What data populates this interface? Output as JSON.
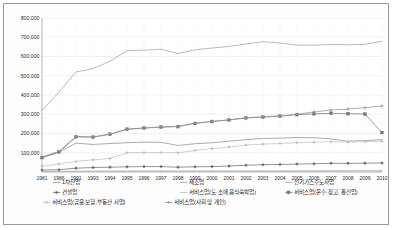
{
  "chart_data": {
    "type": "line",
    "title": "",
    "xlabel": "",
    "ylabel": "",
    "ylim": [
      0,
      800000
    ],
    "ytick_step": 100000,
    "grid": true,
    "legend_position": "bottom",
    "categories": [
      "1981",
      "1986",
      "1991",
      "1993",
      "1994",
      "1995",
      "1996",
      "1997",
      "1998",
      "1999",
      "2000",
      "2001",
      "2002",
      "2003",
      "2004",
      "2005",
      "2006",
      "2007",
      "2008",
      "2009",
      "2010"
    ],
    "ytick_labels": [
      "800,000",
      "700,000",
      "600,000",
      "500,000",
      "400,000",
      "300,000",
      "200,000",
      "100,000"
    ],
    "ytick_values": [
      800000,
      700000,
      600000,
      500000,
      400000,
      300000,
      200000,
      100000
    ],
    "series": [
      {
        "name": "1차산업",
        "color": "#8c8c8c",
        "marker": "none",
        "values": [
          75000,
          103000,
          150000,
          143000,
          148000,
          152000,
          155000,
          154000,
          138000,
          147000,
          152000,
          160000,
          168000,
          174000,
          176000,
          179000,
          178000,
          172000,
          160000,
          163000,
          168000
        ]
      },
      {
        "name": "제조업",
        "color": "#9f9f9f",
        "marker": "none",
        "values": [
          320000,
          415000,
          520000,
          537000,
          575000,
          630000,
          633000,
          638000,
          615000,
          635000,
          644000,
          652000,
          665000,
          677000,
          670000,
          659000,
          659000,
          662000,
          661000,
          663000,
          679000
        ]
      },
      {
        "name": "전기가스수도사업",
        "color": "#a8a8a8",
        "marker": "none",
        "values": [
          3000,
          3500,
          4000,
          4200,
          4400,
          4600,
          4800,
          4900,
          4800,
          4900,
          5000,
          5100,
          5200,
          5300,
          5400,
          5500,
          5600,
          5700,
          5800,
          5900,
          6000
        ]
      },
      {
        "name": "건설업",
        "color": "#6b6b6b",
        "marker": "diamond",
        "values": [
          10000,
          12000,
          20000,
          23000,
          25000,
          27000,
          28000,
          28000,
          25000,
          27000,
          28000,
          31000,
          35000,
          38000,
          39000,
          41000,
          43000,
          45000,
          45000,
          46000,
          47000
        ]
      },
      {
        "name": "서비스업(도·소매 음식숙박업)",
        "color": "#b5b5b5",
        "marker": "none",
        "values": [
          2000,
          2500,
          3000,
          3200,
          3400,
          3600,
          3800,
          3900,
          3800,
          3900,
          4000,
          4100,
          4200,
          4300,
          4400,
          4500,
          4600,
          4700,
          4800,
          4900,
          5000
        ]
      },
      {
        "name": "서비스업(운수·창고, 통신업)",
        "color": "#777777",
        "marker": "square",
        "values": [
          75000,
          104000,
          183000,
          181000,
          196000,
          222000,
          228000,
          233000,
          236000,
          252000,
          262000,
          270000,
          281000,
          285000,
          290000,
          298000,
          302000,
          305000,
          303000,
          301000,
          205000
        ]
      },
      {
        "name": "서비스업(금융,보험,부동산 사업)",
        "color": "#bdbdbd",
        "marker": "star",
        "values": [
          30000,
          42000,
          55000,
          63000,
          70000,
          100000,
          101000,
          101000,
          100000,
          112000,
          121000,
          130000,
          140000,
          145000,
          148000,
          152000,
          155000,
          157000,
          155000,
          158000,
          160000
        ]
      },
      {
        "name": "서비스업(사회 및 개인)",
        "color": "#8f8f8f",
        "marker": "cross",
        "values": [
          78000,
          108000,
          185000,
          182000,
          197000,
          223000,
          229000,
          234000,
          237000,
          254000,
          263000,
          271000,
          282000,
          287000,
          292000,
          300000,
          312000,
          322000,
          327000,
          334000,
          343000
        ]
      }
    ],
    "plot_overrides": {
      "note_markers_square_series": "서비스업(운수·창고, 통신업)",
      "series_with_markers": [
        "건설업",
        "서비스업(운수·창고, 통신업)",
        "서비스업(금융,보험,부동산 사업)",
        "서비스업(사회 및 개인)"
      ]
    }
  },
  "legend": {
    "rows": [
      [
        {
          "label": "1차산업",
          "marker": "line",
          "color": "#8c8c8c"
        },
        {
          "label": "제조업",
          "marker": "line",
          "color": "#9f9f9f"
        },
        {
          "label": "전기가스수도사업",
          "marker": "line",
          "color": "#a8a8a8"
        }
      ],
      [
        {
          "label": "건설업",
          "marker": "diamond",
          "color": "#6b6b6b"
        },
        {
          "label": "서비스업(도·소매 음식숙박업)",
          "marker": "line",
          "color": "#b5b5b5"
        },
        {
          "label": "서비스업(운수·창고, 통신업)",
          "marker": "square",
          "color": "#777777"
        }
      ],
      [
        {
          "label": "서비스업(금융,보험,부동산 사업)",
          "marker": "star",
          "color": "#bdbdbd"
        },
        {
          "label": "서비스업(사회 및 개인)",
          "marker": "cross",
          "color": "#8f8f8f"
        }
      ]
    ]
  }
}
